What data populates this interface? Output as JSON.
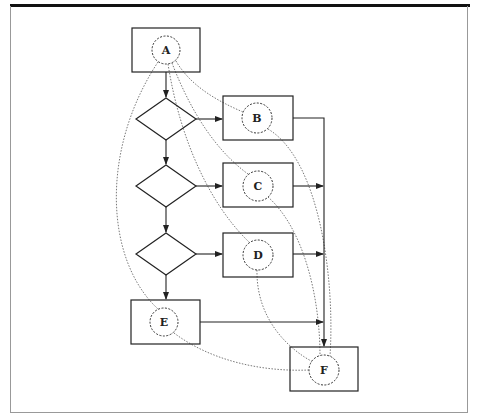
{
  "diagram": {
    "type": "flowchart",
    "colors": {
      "stroke": "#222222",
      "frame": "#999999",
      "dotted": "#555555",
      "background": "#ffffff"
    },
    "nodes": [
      {
        "id": "A",
        "label": "A",
        "box": [
          132,
          28,
          68,
          44
        ],
        "circle": [
          166,
          50,
          14
        ]
      },
      {
        "id": "B",
        "label": "B",
        "box": [
          223,
          96,
          70,
          44
        ],
        "circle": [
          257,
          118,
          15
        ]
      },
      {
        "id": "C",
        "label": "C",
        "box": [
          223,
          163,
          70,
          44
        ],
        "circle": [
          258,
          186,
          15
        ]
      },
      {
        "id": "D",
        "label": "D",
        "box": [
          223,
          233,
          70,
          44
        ],
        "circle": [
          258,
          255,
          15
        ]
      },
      {
        "id": "E",
        "label": "E",
        "box": [
          131,
          300,
          69,
          44
        ],
        "circle": [
          164,
          322,
          14
        ]
      },
      {
        "id": "F",
        "label": "F",
        "box": [
          290,
          347,
          68,
          44
        ],
        "circle": [
          324,
          370,
          15
        ]
      }
    ],
    "decisions": [
      {
        "id": "d1",
        "cx": 166,
        "cy": 119
      },
      {
        "id": "d2",
        "cx": 166,
        "cy": 186
      },
      {
        "id": "d3",
        "cx": 166,
        "cy": 254
      }
    ],
    "solid_edges": [
      "A->d1",
      "d1->B",
      "d1->d2",
      "d2->C",
      "d2->d3",
      "d3->D",
      "d3->E",
      "B->F",
      "C->F",
      "D->F",
      "E->F"
    ],
    "dotted_edges": [
      "A-B",
      "A-C",
      "A-D",
      "A-E",
      "B-F",
      "C-F",
      "D-F",
      "E-F"
    ]
  }
}
